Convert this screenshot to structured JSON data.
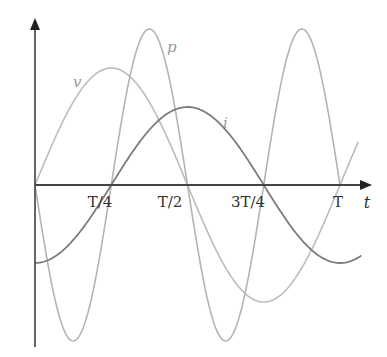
{
  "chart_data": {
    "type": "line",
    "title": "",
    "xlabel": "t",
    "ylabel": "",
    "x_ticks": [
      "T/4",
      "T/2",
      "3T/4",
      "T"
    ],
    "x_tick_values": [
      0.25,
      0.5,
      0.75,
      1.0
    ],
    "xlim": [
      0,
      1.06
    ],
    "ylim": [
      -1.0,
      1.0
    ],
    "grid": false,
    "legend": "inline curve labels",
    "series": [
      {
        "name": "v",
        "description": "voltage, sin(2πt/T), amplitude ≈ 0.75",
        "x": [
          0,
          0.125,
          0.25,
          0.375,
          0.5,
          0.625,
          0.75,
          0.875,
          1.0,
          1.05
        ],
        "values": [
          0,
          0.53,
          0.75,
          0.53,
          0,
          -0.53,
          -0.75,
          -0.53,
          0,
          0.23
        ],
        "color": "#b8b8b8"
      },
      {
        "name": "i",
        "description": "current, -cos(2πt/T), amplitude ≈ 0.5",
        "x": [
          0,
          0.125,
          0.25,
          0.375,
          0.5,
          0.625,
          0.75,
          0.875,
          1.0,
          1.07
        ],
        "values": [
          -0.5,
          -0.35,
          0,
          0.35,
          0.5,
          0.35,
          0,
          -0.35,
          -0.5,
          -0.45
        ],
        "color": "#7a7a7a"
      },
      {
        "name": "p",
        "description": "power, -sin(4πt/T), amplitude ≈ 1.0",
        "x": [
          0,
          0.125,
          0.25,
          0.375,
          0.5,
          0.625,
          0.75,
          0.875,
          1.0
        ],
        "values": [
          0,
          -1.0,
          0,
          1.0,
          0,
          -1.0,
          0,
          1.0,
          0
        ],
        "color": "#b0b0b0"
      }
    ],
    "annotations": [
      "v",
      "p",
      "i"
    ]
  },
  "labels": {
    "t_axis": "t",
    "tick_t4": "T/4",
    "tick_t2": "T/2",
    "tick_3t4": "3T/4",
    "tick_t": "T",
    "curve_v": "v",
    "curve_p": "p",
    "curve_i": "i"
  }
}
